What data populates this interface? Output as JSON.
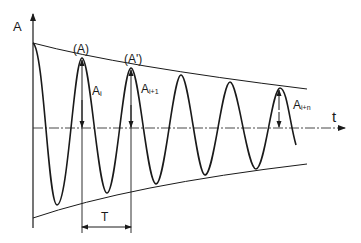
{
  "diagram": {
    "type": "damped-oscillation",
    "labels": {
      "y_axis": "A",
      "x_axis": "t",
      "peak_a": "(A)",
      "peak_a_prime": "(A')",
      "amp_i": "A",
      "amp_i_sub": "i",
      "amp_i1": "A",
      "amp_i1_sub": "i+1",
      "amp_in": "A",
      "amp_in_sub": "i+n",
      "period": "T"
    },
    "colors": {
      "line": "#1a1a1a",
      "background": "#ffffff"
    }
  }
}
